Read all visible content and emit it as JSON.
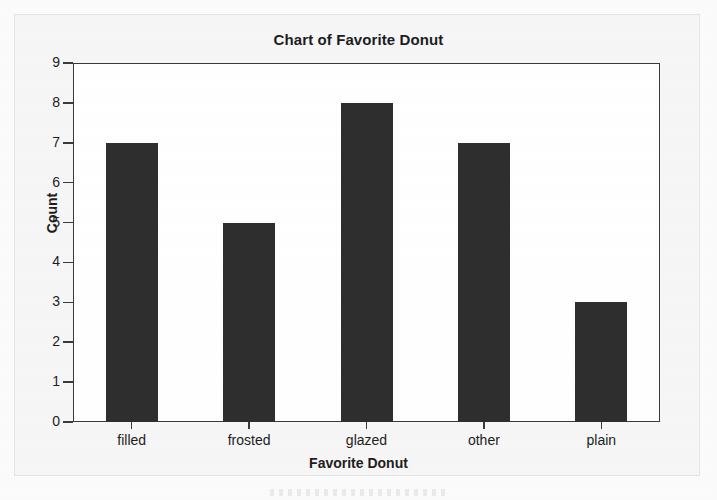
{
  "chart_data": {
    "type": "bar",
    "title": "Chart of Favorite Donut",
    "xlabel": "Favorite Donut",
    "ylabel": "Count",
    "categories": [
      "filled",
      "frosted",
      "glazed",
      "other",
      "plain"
    ],
    "values": [
      7,
      5,
      8,
      7,
      3
    ],
    "ylim": [
      0,
      9
    ],
    "yticks": [
      0,
      1,
      2,
      3,
      4,
      5,
      6,
      7,
      8,
      9
    ],
    "ytick_labels": [
      "0",
      "1",
      "2",
      "3",
      "4",
      "5",
      "6",
      "7",
      "8",
      "9"
    ],
    "grid": false,
    "legend": null,
    "bar_color": "#2e2e2e",
    "frame_color": "#3a3a3a",
    "plot_background": "#ffffff",
    "page_background": "#f6f6f6"
  },
  "page": {
    "title": "Chart of Favorite Donut"
  }
}
